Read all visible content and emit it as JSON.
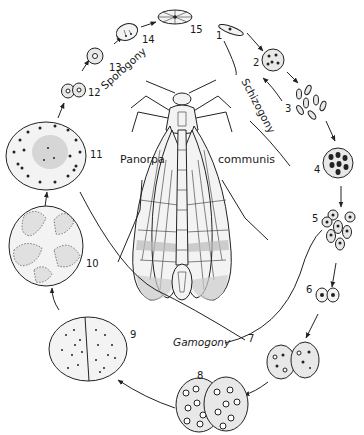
{
  "figure": {
    "host": {
      "genus": "Panorpa",
      "species": "communis"
    },
    "phases": {
      "schizogony": "Schizogony",
      "gamogony": "Gamogony",
      "sporogony": "Sporogony"
    },
    "stages": [
      {
        "n": "1",
        "label": "1",
        "desc": "sporozoite (elongate)"
      },
      {
        "n": "2",
        "label": "2",
        "desc": "schizont with nuclei"
      },
      {
        "n": "3",
        "label": "3",
        "desc": "merozoites released"
      },
      {
        "n": "4",
        "label": "4",
        "desc": "schizont, second generation"
      },
      {
        "n": "5",
        "label": "5",
        "desc": "merozoites"
      },
      {
        "n": "6",
        "label": "6",
        "desc": "young gamonts paired"
      },
      {
        "n": "7",
        "label": "7",
        "desc": "gamonts in association"
      },
      {
        "n": "8",
        "label": "8",
        "desc": "large paired gamonts"
      },
      {
        "n": "9",
        "label": "9",
        "desc": "gametocyst"
      },
      {
        "n": "10",
        "label": "10",
        "desc": "gamete formation"
      },
      {
        "n": "11",
        "label": "11",
        "desc": "cyst with zygotes"
      },
      {
        "n": "12",
        "label": "12",
        "desc": "zygote pair"
      },
      {
        "n": "13",
        "label": "13",
        "desc": "sporoblast"
      },
      {
        "n": "14",
        "label": "14",
        "desc": "sporocyst with sporozoites"
      },
      {
        "n": "15",
        "label": "15",
        "desc": "mature spore"
      }
    ],
    "colors": {
      "ink": "#222222",
      "cell_fill": "#e8e8e8",
      "background": "#ffffff"
    }
  }
}
